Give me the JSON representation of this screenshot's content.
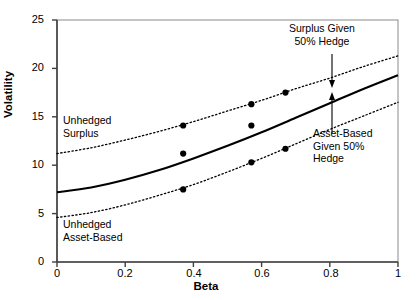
{
  "chart_data": {
    "type": "line",
    "title": "",
    "xlabel": "Beta",
    "ylabel": "Volatility",
    "xlim": [
      0,
      1
    ],
    "ylim": [
      0,
      25
    ],
    "xticks": [
      "0",
      "0.2",
      "0.4",
      "0.6",
      "0.8",
      "1"
    ],
    "xtick_values": [
      0,
      0.2,
      0.4,
      0.6,
      0.8,
      1
    ],
    "yticks": [
      "0",
      "5",
      "10",
      "15",
      "20",
      "25"
    ],
    "ytick_values": [
      0,
      5,
      10,
      15,
      20,
      25
    ],
    "grid": false,
    "legend": "annotations-inline",
    "series": [
      {
        "name": "Unhedged Surplus",
        "style": "dotted",
        "x": [
          0,
          0.1,
          0.2,
          0.3,
          0.4,
          0.5,
          0.6,
          0.7,
          0.8,
          0.9,
          1
        ],
        "values": [
          11.2,
          11.8,
          12.6,
          13.5,
          14.5,
          15.6,
          16.7,
          17.9,
          19.0,
          20.2,
          21.3
        ]
      },
      {
        "name": "Surplus Given 50% Hedge",
        "style": "solid",
        "x": [
          0,
          0.1,
          0.2,
          0.3,
          0.4,
          0.5,
          0.6,
          0.7,
          0.8,
          0.9,
          1
        ],
        "values": [
          7.2,
          7.7,
          8.5,
          9.5,
          10.7,
          12.0,
          13.4,
          14.9,
          16.4,
          17.9,
          19.3
        ]
      },
      {
        "name": "Unhedged Asset-Based",
        "style": "dotted",
        "x": [
          0,
          0.1,
          0.2,
          0.3,
          0.4,
          0.5,
          0.6,
          0.7,
          0.8,
          0.9,
          1
        ],
        "values": [
          4.6,
          5.1,
          5.9,
          6.9,
          8.0,
          9.3,
          10.7,
          12.2,
          13.7,
          15.1,
          16.5
        ]
      }
    ],
    "points": [
      {
        "series": "Unhedged Surplus",
        "x": 0.37,
        "y": 14.1
      },
      {
        "series": "Unhedged Surplus",
        "x": 0.57,
        "y": 16.3
      },
      {
        "series": "Unhedged Surplus",
        "x": 0.67,
        "y": 17.5
      },
      {
        "series": "Surplus Given 50% Hedge",
        "x": 0.37,
        "y": 11.2
      },
      {
        "series": "Surplus Given 50% Hedge",
        "x": 0.57,
        "y": 14.1
      },
      {
        "series": "Unhedged Asset-Based",
        "x": 0.37,
        "y": 7.5
      },
      {
        "series": "Unhedged Asset-Based",
        "x": 0.57,
        "y": 10.3
      },
      {
        "series": "Unhedged Asset-Based",
        "x": 0.67,
        "y": 11.7
      }
    ],
    "annotations": [
      {
        "id": "surplus-hedge",
        "text": "Surplus Given\n50% Hedge",
        "x": 0.79,
        "y": 23.3,
        "arrow": "down"
      },
      {
        "id": "asset-hedge",
        "text": "Asset-Based\nGiven 50%\nHedge",
        "x": 0.8,
        "y": 12.8,
        "arrow": "up"
      },
      {
        "id": "unhedged-surplus",
        "text": "Unhedged\nSurplus",
        "x": 0.07,
        "y": 13.7,
        "arrow": "none"
      },
      {
        "id": "unhedged-asset",
        "text": "Unhedged\nAsset-Based",
        "x": 0.07,
        "y": 3.7,
        "arrow": "none"
      }
    ],
    "colors": {
      "line": "#000000",
      "point": "#000000",
      "axis": "#4a4a4a",
      "frame": "#7a7a7a",
      "background": "#ffffff"
    }
  }
}
